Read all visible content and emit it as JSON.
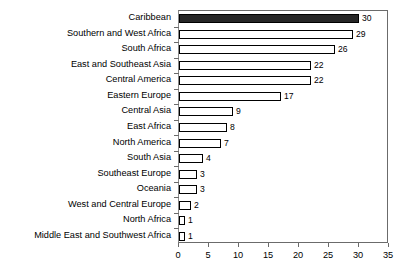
{
  "chart_data": {
    "type": "bar",
    "orientation": "horizontal",
    "title": "",
    "subtitle": "",
    "xlabel": "",
    "ylabel": "",
    "xlim": [
      0,
      35
    ],
    "xticks": [
      0,
      5,
      10,
      15,
      20,
      25,
      30,
      35
    ],
    "xtick_labels": [
      "0",
      "5",
      "10",
      "15",
      "20",
      "25",
      "30",
      "35"
    ],
    "grid": false,
    "legend": null,
    "legend_position": "none",
    "highlight_category": "Caribbean",
    "colors": {
      "bar_fill": "#ffffff",
      "bar_border": "#000000",
      "highlight_fill": "#262626",
      "axis": "#6b6b6b",
      "text": "#000000",
      "background": "#ffffff"
    },
    "categories": [
      "Caribbean",
      "Southern and West Africa",
      "South Africa",
      "East and Southeast Asia",
      "Central America",
      "Eastern Europe",
      "Central Asia",
      "East Africa",
      "North America",
      "South Asia",
      "Southeast Europe",
      "Oceania",
      "West and Central Europe",
      "North Africa",
      "Middle East and Southwest Africa"
    ],
    "values": [
      30,
      29,
      26,
      22,
      22,
      17,
      9,
      8,
      7,
      4,
      3,
      3,
      2,
      1,
      1
    ],
    "value_labels": [
      "30",
      "29",
      "26",
      "22",
      "22",
      "17",
      "9",
      "8",
      "7",
      "4",
      "3",
      "3",
      "2",
      "1",
      "1"
    ]
  }
}
